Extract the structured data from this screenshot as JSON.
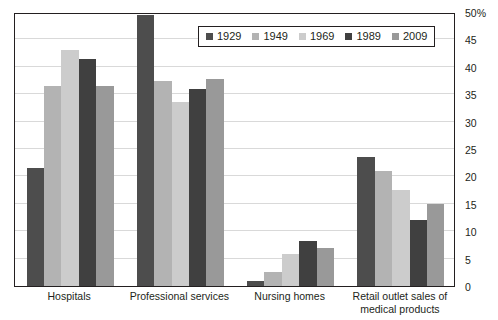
{
  "chart_data": {
    "type": "bar",
    "title": "",
    "subtitle": "",
    "xlabel": "",
    "ylabel": "",
    "ylim": [
      0,
      50
    ],
    "ytick_values": [
      0,
      5,
      10,
      15,
      20,
      25,
      30,
      35,
      40,
      45,
      50
    ],
    "ytick_labels": [
      "0",
      "5",
      "10",
      "15",
      "20",
      "25",
      "30",
      "35",
      "40",
      "45",
      "50%"
    ],
    "grid": true,
    "legend_position": "top-center",
    "categories": [
      "Hospitals",
      "Professional services",
      "Nursing homes",
      "Retail outlet sales of medical products"
    ],
    "category_lines": [
      [
        "Hospitals"
      ],
      [
        "Professional services"
      ],
      [
        "Nursing homes"
      ],
      [
        "Retail outlet sales of",
        "medical products"
      ]
    ],
    "series": [
      {
        "name": "1929",
        "color": "#4d4d4d",
        "values": [
          21.5,
          49.5,
          1.0,
          23.5
        ]
      },
      {
        "name": "1949",
        "color": "#b3b3b3",
        "values": [
          36.5,
          37.5,
          2.5,
          21.0
        ]
      },
      {
        "name": "1969",
        "color": "#cccccc",
        "values": [
          43.0,
          33.5,
          5.8,
          17.5
        ]
      },
      {
        "name": "1989",
        "color": "#404040",
        "values": [
          41.5,
          36.0,
          8.3,
          12.0
        ]
      },
      {
        "name": "2009",
        "color": "#999999",
        "values": [
          36.5,
          37.8,
          7.0,
          15.0
        ]
      }
    ]
  },
  "axis_style": {
    "frame_color": "#231f20",
    "grid_color": "#d9d9d9",
    "text_color": "#231f20"
  }
}
